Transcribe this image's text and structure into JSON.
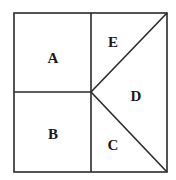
{
  "diagram": {
    "type": "partitioned-square",
    "stroke_color": "#2a2a2a",
    "regions": [
      {
        "id": "A",
        "label": "A",
        "shape": "square",
        "position": "top-left"
      },
      {
        "id": "B",
        "label": "B",
        "shape": "square",
        "position": "bottom-left"
      },
      {
        "id": "C",
        "label": "C",
        "shape": "triangle",
        "position": "bottom-right-lower"
      },
      {
        "id": "D",
        "label": "D",
        "shape": "triangle",
        "position": "right"
      },
      {
        "id": "E",
        "label": "E",
        "shape": "triangle",
        "position": "top-right-upper"
      }
    ]
  }
}
